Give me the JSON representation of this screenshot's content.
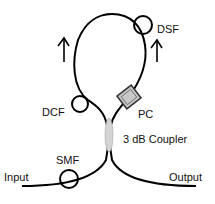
{
  "diagram": {
    "type": "fiber-loop-schematic",
    "components": {
      "input": "Input",
      "output": "Output",
      "smf": "SMF",
      "dcf": "DCF",
      "dsf": "DSF",
      "pc": "PC",
      "coupler": "3 dB Coupler"
    },
    "colors": {
      "line": "#000000",
      "coupler_fill": "#d4d4d4",
      "pc_fill": "#c8c8c8"
    }
  }
}
